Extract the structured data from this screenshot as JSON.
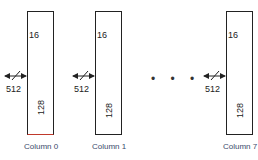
{
  "diagram": {
    "columns": [
      {
        "label": "Column 0",
        "width_label": "16",
        "height_label": "128",
        "input_label": "512"
      },
      {
        "label": "Column 1",
        "width_label": "16",
        "height_label": "128",
        "input_label": "512"
      },
      {
        "label": "Column 7",
        "width_label": "16",
        "height_label": "128",
        "input_label": "512"
      }
    ],
    "ellipsis": "• • •",
    "colors": {
      "line": "#222222",
      "label": "#3a4a6a",
      "accent": "#c0392b"
    }
  }
}
